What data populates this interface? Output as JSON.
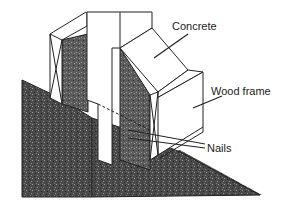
{
  "diagram": {
    "type": "technical illustration",
    "colors": {
      "fill_dark": "#3a3a3a",
      "fill_mid": "#6a6a6a",
      "line": "#222222",
      "background": "#ffffff"
    },
    "labels": {
      "concrete": "Concrete",
      "wood_frame": "Wood frame",
      "nails": "Nails"
    }
  }
}
